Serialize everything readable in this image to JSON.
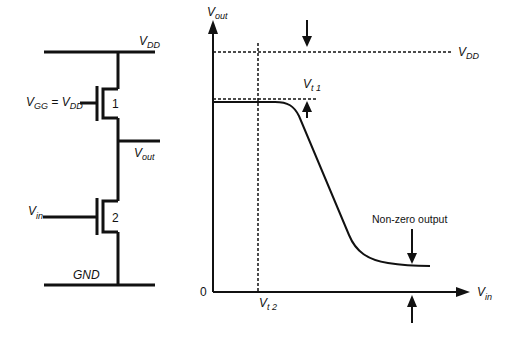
{
  "circuit": {
    "vdd_label": "V",
    "vdd_sub": "DD",
    "vgg_label": "V",
    "vgg_sub": "GG",
    "equals": " = ",
    "vgg_eq_label": "V",
    "vgg_eq_sub": "DD",
    "transistor1_label": "1",
    "vout_label": "V",
    "vout_sub": "out",
    "vin_label": "V",
    "vin_sub": "in",
    "transistor2_label": "2",
    "gnd_label": "GND"
  },
  "graph": {
    "y_axis_label": "V",
    "y_axis_sub": "out",
    "x_axis_label": "V",
    "x_axis_sub": "in",
    "origin_label": "0",
    "vdd_line_label": "V",
    "vdd_line_sub": "DD",
    "vt1_label": "V",
    "vt1_sub": "t 1",
    "vt2_label": "V",
    "vt2_sub": "t 2",
    "annotation": "Non-zero output"
  },
  "colors": {
    "stroke": "#111111",
    "background": "#ffffff"
  }
}
